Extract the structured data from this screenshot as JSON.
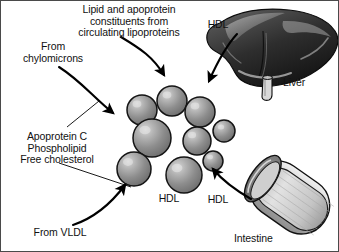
{
  "figure": {
    "title_label": "Lipid and apoprotein\nconstituents from\ncirculating lipoproteins",
    "background_color": "#ffffff",
    "border_color": "#4a4a4a",
    "width": 339,
    "height": 252
  },
  "labels": {
    "from_chylomicrons": "From\nchylomicrons",
    "apoprotein_group": "Apoprotein C\nPhospholipid\nFree cholesterol",
    "from_vldl": "From VLDL",
    "hdl_top": "HDL",
    "hdl_center": "HDL",
    "hdl_intestine": "HDL",
    "liver": "Liver",
    "intestine": "Intestine"
  },
  "organs": [
    {
      "name": "liver",
      "label": "Liver",
      "fill_dark": "#2b2b2b",
      "fill_mid": "#5c5c5c",
      "highlight": "#d8d8d8"
    },
    {
      "name": "intestine",
      "label": "Intestine",
      "fill_light": "#d5d5d5",
      "fill_mid": "#9a9a9a",
      "outline": "#1a1a1a"
    }
  ],
  "particles": {
    "name": "hdl-particle-cluster",
    "count": 9,
    "fill": "#8a8a8a",
    "highlight": "#cccccc",
    "outline": "#1a1a1a",
    "spheres": [
      {
        "cx": 141,
        "cy": 109,
        "r": 15
      },
      {
        "cx": 171,
        "cy": 100,
        "r": 15
      },
      {
        "cx": 199,
        "cy": 111,
        "r": 15
      },
      {
        "cx": 223,
        "cy": 130,
        "r": 11
      },
      {
        "cx": 151,
        "cy": 137,
        "r": 19
      },
      {
        "cx": 196,
        "cy": 140,
        "r": 14
      },
      {
        "cx": 133,
        "cy": 168,
        "r": 17
      },
      {
        "cx": 183,
        "cy": 174,
        "r": 18
      },
      {
        "cx": 212,
        "cy": 160,
        "r": 10
      }
    ]
  },
  "arrows": [
    {
      "name": "arrow-circulating-lipoproteins",
      "from": "title-label",
      "to": "hdl-cluster"
    },
    {
      "name": "arrow-from-chylomicrons",
      "from": "from-chylomicrons-label",
      "to": "hdl-cluster"
    },
    {
      "name": "arrow-from-vldl",
      "from": "from-vldl-label",
      "to": "hdl-cluster"
    },
    {
      "name": "arrow-hdl-from-liver",
      "from": "liver",
      "to": "hdl-cluster"
    },
    {
      "name": "arrow-hdl-from-intestine",
      "from": "intestine",
      "to": "hdl-cluster"
    }
  ],
  "leader_lines": [
    {
      "name": "leader-chylomicrons-to-apoprotein"
    },
    {
      "name": "leader-apoprotein-to-cluster"
    }
  ]
}
